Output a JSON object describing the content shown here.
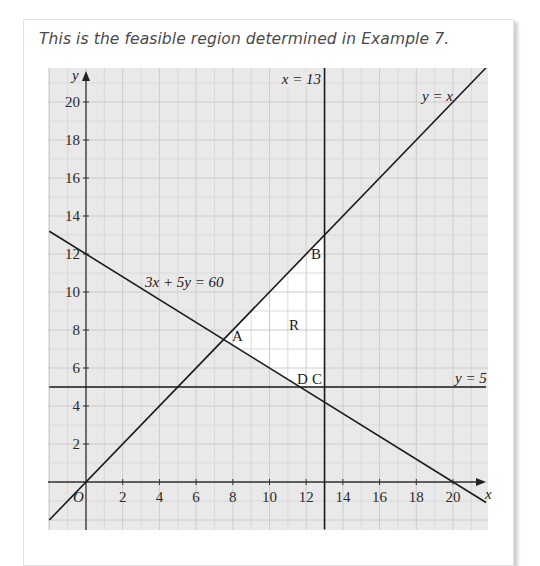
{
  "caption": "This is the feasible region determined in Example 7.",
  "colors": {
    "grid_background": "#e9e9e9",
    "minor_grid": "#d9d9d9",
    "major_grid": "#cccccc",
    "feasible_region": "#ffffff",
    "lines": "#1a1a1a"
  },
  "axes": {
    "x_label": "x",
    "y_label": "y",
    "origin_label": "O",
    "x_ticks": [
      "2",
      "4",
      "6",
      "8",
      "10",
      "12",
      "14",
      "16",
      "18",
      "20"
    ],
    "y_ticks": [
      "2",
      "4",
      "6",
      "8",
      "10",
      "12",
      "14",
      "16",
      "18",
      "20"
    ]
  },
  "line_labels": {
    "x13": "x = 13",
    "yx": "y = x",
    "c1": "3x + 5y = 60",
    "y5": "y = 5"
  },
  "point_labels": {
    "A": "A",
    "B": "B",
    "C": "C",
    "D": "D",
    "R": "R"
  },
  "chart_data": {
    "type": "line",
    "title": "Feasible region determined in Example 7",
    "xlabel": "x",
    "ylabel": "y",
    "xlim": [
      -2,
      21.8
    ],
    "ylim": [
      -2.5,
      21.8
    ],
    "grid": true,
    "series": [
      {
        "name": "y = x",
        "equation": "y = x",
        "points": [
          [
            -2,
            -2
          ],
          [
            21.8,
            21.8
          ]
        ]
      },
      {
        "name": "3x + 5y = 60",
        "equation": "3x + 5y = 60",
        "points": [
          [
            -2,
            13.2
          ],
          [
            21.8,
            -1.08
          ]
        ]
      },
      {
        "name": "x = 13",
        "equation": "x = 13",
        "points": [
          [
            13,
            -2.5
          ],
          [
            13,
            21.8
          ]
        ]
      },
      {
        "name": "y = 5",
        "equation": "y = 5",
        "points": [
          [
            -2,
            5
          ],
          [
            21.8,
            5
          ]
        ]
      }
    ],
    "feasible_region": {
      "label": "R",
      "vertices": [
        [
          7.5,
          7.5
        ],
        [
          13,
          13
        ],
        [
          13,
          5
        ],
        [
          11.67,
          5
        ]
      ]
    },
    "annotations": [
      {
        "label": "A",
        "x": 7.5,
        "y": 7.5
      },
      {
        "label": "B",
        "x": 13,
        "y": 13
      },
      {
        "label": "C",
        "x": 13,
        "y": 5
      },
      {
        "label": "D",
        "x": 11.67,
        "y": 5
      },
      {
        "label": "R",
        "x": 11,
        "y": 8.5
      }
    ]
  }
}
